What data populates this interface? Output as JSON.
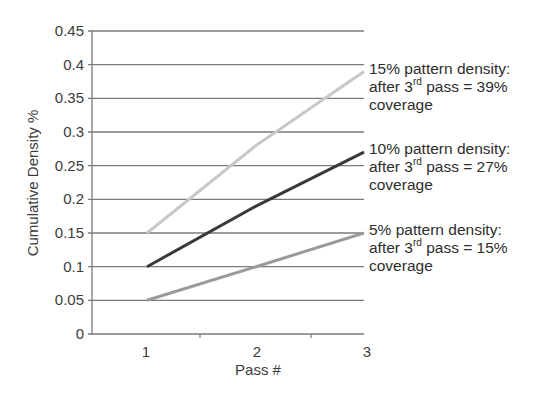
{
  "chart_data": {
    "type": "line",
    "title": "",
    "xlabel": "Pass #",
    "ylabel": "Cumulative Density %",
    "categories": [
      "1",
      "2",
      "3"
    ],
    "x": [
      1,
      2,
      3
    ],
    "ylim": [
      0,
      0.45
    ],
    "yticks": [
      0,
      0.05,
      0.1,
      0.15,
      0.2,
      0.25,
      0.3,
      0.35,
      0.4,
      0.45
    ],
    "ytick_labels": [
      "0",
      "0.05",
      "0.1",
      "0.15",
      "0.2",
      "0.25",
      "0.3",
      "0.35",
      "0.4",
      "0.45"
    ],
    "grid": true,
    "legend": "none (direct labels right of plot)",
    "series": [
      {
        "name": "15% pattern density",
        "values": [
          0.15,
          0.28,
          0.39
        ],
        "color": "#c8c8c8"
      },
      {
        "name": "10% pattern density",
        "values": [
          0.1,
          0.19,
          0.27
        ],
        "color": "#3a3a3a"
      },
      {
        "name": "5% pattern density",
        "values": [
          0.05,
          0.1,
          0.15
        ],
        "color": "#9a9a9a"
      }
    ],
    "annotations": [
      {
        "line1": "15% pattern density:",
        "line2_pre": "after 3",
        "line2_sup": "rd",
        "line2_post": " pass = 39%",
        "line3": "coverage"
      },
      {
        "line1": "10% pattern density:",
        "line2_pre": "after 3",
        "line2_sup": "rd",
        "line2_post": " pass = 27%",
        "line3": "coverage"
      },
      {
        "line1": "5% pattern density:",
        "line2_pre": "after 3",
        "line2_sup": "rd",
        "line2_post": " pass = 15%",
        "line3": "coverage"
      }
    ]
  },
  "colors": {
    "grid": "#7a7a7a",
    "axis": "#7a7a7a",
    "text": "#3c3c3c"
  }
}
